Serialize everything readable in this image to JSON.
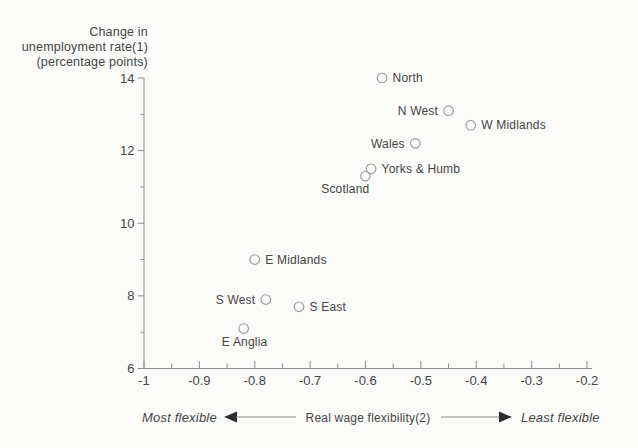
{
  "figure": {
    "background": "#fbfbf9",
    "axis_color": "#8d8d8d",
    "text_color": "#454545",
    "marker_color": "#9c9c9c",
    "arrow_color": "#2e2e2e"
  },
  "chart_data": {
    "type": "scatter",
    "title": "Change in unemployment rate(1) (percentage points)",
    "title_lines": [
      "Change in",
      "unemployment rate(1)",
      "(percentage points)"
    ],
    "xlabel": "Real wage flexibility(2)",
    "ylabel": "Change in unemployment rate(1) (percentage points)",
    "annotation": {
      "left": "Most flexible",
      "right": "Least flexible"
    },
    "xlim": [
      -1.0,
      -0.2
    ],
    "ylim": [
      6,
      14
    ],
    "x_ticks": [
      -1.0,
      -0.9,
      -0.8,
      -0.7,
      -0.6,
      -0.5,
      -0.4,
      -0.3,
      -0.2
    ],
    "x_tick_labels": [
      "-1",
      "-0.9",
      "-0.8",
      "-0.7",
      "-0.6",
      "-0.5",
      "-0.4",
      "-0.3",
      "-0.2"
    ],
    "x_minor_ticks": [
      -0.95,
      -0.85,
      -0.75,
      -0.65,
      -0.55,
      -0.45,
      -0.35,
      -0.25
    ],
    "y_ticks": [
      6,
      8,
      10,
      12,
      14
    ],
    "y_tick_labels": [
      "6",
      "8",
      "10",
      "12",
      "14"
    ],
    "y_minor_ticks": [
      7,
      9,
      11,
      13
    ],
    "grid": false,
    "legend": "none",
    "marker": "open-circle",
    "points": [
      {
        "label": "North",
        "x": -0.57,
        "y": 14.0,
        "label_side": "right"
      },
      {
        "label": "N West",
        "x": -0.45,
        "y": 13.1,
        "label_side": "left"
      },
      {
        "label": "W Midlands",
        "x": -0.41,
        "y": 12.7,
        "label_side": "right"
      },
      {
        "label": "Wales",
        "x": -0.51,
        "y": 12.2,
        "label_side": "left"
      },
      {
        "label": "Yorks & Humb",
        "x": -0.59,
        "y": 11.5,
        "label_side": "right"
      },
      {
        "label": "Scotland",
        "x": -0.6,
        "y": 11.3,
        "label_side": "below-left"
      },
      {
        "label": "E Midlands",
        "x": -0.8,
        "y": 9.0,
        "label_side": "right"
      },
      {
        "label": "S West",
        "x": -0.78,
        "y": 7.9,
        "label_side": "left"
      },
      {
        "label": "S East",
        "x": -0.72,
        "y": 7.7,
        "label_side": "right"
      },
      {
        "label": "E Anglia",
        "x": -0.82,
        "y": 7.1,
        "label_side": "below"
      }
    ]
  }
}
